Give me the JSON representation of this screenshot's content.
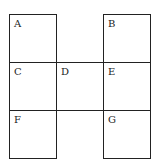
{
  "diagram": {
    "type": "grid-of-cells",
    "cells": [
      {
        "label": "A",
        "row": 0,
        "col": 0
      },
      {
        "label": "B",
        "row": 0,
        "col": 2
      },
      {
        "label": "C",
        "row": 1,
        "col": 0
      },
      {
        "label": "D",
        "row": 1,
        "col": 1
      },
      {
        "label": "E",
        "row": 1,
        "col": 2
      },
      {
        "label": "F",
        "row": 2,
        "col": 0
      },
      {
        "label": "G",
        "row": 2,
        "col": 2
      }
    ]
  }
}
